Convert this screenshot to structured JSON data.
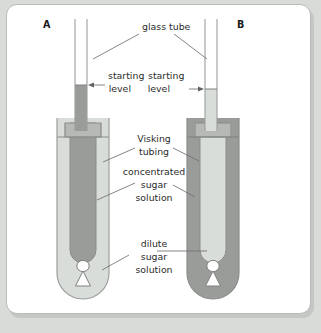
{
  "figure": {
    "title_letters": {
      "left_panel": "A",
      "right_panel": "B"
    },
    "callouts": {
      "glass_tube": "glass tube",
      "starting_level_left_line1": "starting",
      "starting_level_left_line2": "level",
      "starting_level_right_line1": "starting",
      "starting_level_right_line2": "level",
      "visking_tubing_line1": "Visking",
      "visking_tubing_line2": "tubing",
      "concentrated_line1": "concentrated",
      "concentrated_line2": "sugar",
      "concentrated_line3": "solution",
      "dilute_line1": "dilute",
      "dilute_line2": "sugar",
      "dilute_line3": "solution"
    },
    "colors": {
      "page_background": "#d9dbd9",
      "panel_background": "#ffffff",
      "panel_border": "#b9bcb9",
      "panel_shadow": "#c4c7c4",
      "concentrated_solution": "#9a9c9a",
      "dilute_solution": "#d9ddd9",
      "beaker_outline": "#9b9e9b",
      "tubing_collar": "#b6b9b6",
      "leader_line": "#6f6f6f",
      "label_text": "#2b2b2b",
      "clip_fill": "#ffffff"
    },
    "panels": [
      {
        "id": "A",
        "letter": "A",
        "beaker_contents": "dilute sugar solution",
        "tubing_contents": "concentrated sugar solution",
        "capillary_contents": "concentrated sugar solution",
        "capillary_liquid_level_label": "starting level"
      },
      {
        "id": "B",
        "letter": "B",
        "beaker_contents": "concentrated sugar solution",
        "tubing_contents": "dilute sugar solution",
        "capillary_contents": "dilute sugar solution",
        "capillary_liquid_level_label": "starting level"
      }
    ]
  }
}
